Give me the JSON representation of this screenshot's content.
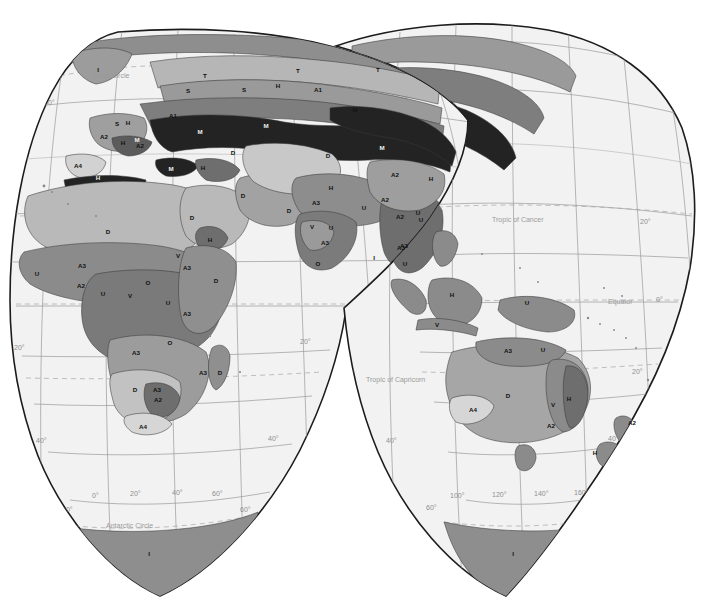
{
  "figure": {
    "kind": "world-map",
    "projection": "interrupted-sinusoidal-homolosine",
    "background_color": "#ffffff",
    "ocean_color": "#f2f2f2",
    "outline_color": "#1c1c1c",
    "graticule_color": "#9a9a9a"
  },
  "reference_lines": [
    {
      "name": "arctic-circle",
      "label": "Arctic Circle"
    },
    {
      "name": "tropic-of-cancer",
      "label": "Tropic of Cancer"
    },
    {
      "name": "equator",
      "label": "Equator"
    },
    {
      "name": "tropic-of-capricorn",
      "label": "Tropic of Capricorn"
    },
    {
      "name": "antarctic-circle",
      "label": "Antarctic Circle"
    }
  ],
  "graticule_labels": {
    "latitudes_left_lobe": [
      "60°",
      "20°",
      "20°",
      "40°",
      "60°"
    ],
    "latitudes_right_lobe": [
      "20°",
      "0°",
      "20°",
      "40°",
      "60°"
    ],
    "longitudes_left_lobe": [
      "0°",
      "20°",
      "40°",
      "60°"
    ],
    "longitudes_right_lobe": [
      "100°",
      "120°",
      "140°",
      "160°"
    ],
    "edge_left": "60°",
    "edge_right": "60°"
  },
  "zone_palette": {
    "ice": "#8e8e8e",
    "tundra": "#9c9c9c",
    "very_dark": "#232323",
    "dark": "#4d4d4d",
    "mid_dark": "#6f6f6f",
    "mid": "#8b8b8b",
    "mid_light": "#a6a6a6",
    "light": "#bdbdbd",
    "very_light": "#d6d6d6",
    "pale": "#e6e6e6"
  },
  "zone_labels": [
    {
      "code": "I",
      "x": 98,
      "y": 72,
      "tone": "light"
    },
    {
      "code": "T",
      "x": 205,
      "y": 78,
      "tone": "dark"
    },
    {
      "code": "T",
      "x": 298,
      "y": 73,
      "tone": "dark"
    },
    {
      "code": "S",
      "x": 188,
      "y": 93,
      "tone": "dark"
    },
    {
      "code": "S",
      "x": 244,
      "y": 92,
      "tone": "dark"
    },
    {
      "code": "H",
      "x": 278,
      "y": 88,
      "tone": "dark"
    },
    {
      "code": "A1",
      "x": 318,
      "y": 92,
      "tone": "dark"
    },
    {
      "code": "H",
      "x": 355,
      "y": 112,
      "tone": "dark"
    },
    {
      "code": "T",
      "x": 378,
      "y": 72,
      "tone": "dark"
    },
    {
      "code": "H",
      "x": 128,
      "y": 125,
      "tone": "dark"
    },
    {
      "code": "A1",
      "x": 173,
      "y": 118,
      "tone": "dark"
    },
    {
      "code": "M",
      "x": 200,
      "y": 134,
      "tone": "lt"
    },
    {
      "code": "M",
      "x": 266,
      "y": 128,
      "tone": "lt"
    },
    {
      "code": "M",
      "x": 382,
      "y": 150,
      "tone": "lt"
    },
    {
      "code": "S",
      "x": 117,
      "y": 126,
      "tone": "dark"
    },
    {
      "code": "A2",
      "x": 104,
      "y": 139,
      "tone": "dark"
    },
    {
      "code": "H",
      "x": 123,
      "y": 145,
      "tone": "dark"
    },
    {
      "code": "M",
      "x": 137,
      "y": 142,
      "tone": "lt"
    },
    {
      "code": "A2",
      "x": 140,
      "y": 148,
      "tone": "dark"
    },
    {
      "code": "A4",
      "x": 78,
      "y": 168,
      "tone": "dark"
    },
    {
      "code": "H",
      "x": 98,
      "y": 180,
      "tone": "lt"
    },
    {
      "code": "M",
      "x": 171,
      "y": 171,
      "tone": "lt"
    },
    {
      "code": "H",
      "x": 203,
      "y": 170,
      "tone": "dark"
    },
    {
      "code": "D",
      "x": 233,
      "y": 155,
      "tone": "dark"
    },
    {
      "code": "D",
      "x": 328,
      "y": 158,
      "tone": "dark"
    },
    {
      "code": "A2",
      "x": 395,
      "y": 177,
      "tone": "dark"
    },
    {
      "code": "H",
      "x": 431,
      "y": 181,
      "tone": "dark"
    },
    {
      "code": "D",
      "x": 108,
      "y": 234,
      "tone": "dark"
    },
    {
      "code": "D",
      "x": 192,
      "y": 220,
      "tone": "dark"
    },
    {
      "code": "H",
      "x": 210,
      "y": 242,
      "tone": "dark"
    },
    {
      "code": "D",
      "x": 243,
      "y": 198,
      "tone": "dark"
    },
    {
      "code": "H",
      "x": 331,
      "y": 190,
      "tone": "dark"
    },
    {
      "code": "D",
      "x": 289,
      "y": 213,
      "tone": "dark"
    },
    {
      "code": "A3",
      "x": 316,
      "y": 205,
      "tone": "dark"
    },
    {
      "code": "V",
      "x": 312,
      "y": 229,
      "tone": "dark"
    },
    {
      "code": "U",
      "x": 331,
      "y": 230,
      "tone": "dark"
    },
    {
      "code": "A3",
      "x": 325,
      "y": 245,
      "tone": "dark"
    },
    {
      "code": "A3",
      "x": 404,
      "y": 248,
      "tone": "dark"
    },
    {
      "code": "A2",
      "x": 400,
      "y": 219,
      "tone": "dark"
    },
    {
      "code": "U",
      "x": 418,
      "y": 215,
      "tone": "dark"
    },
    {
      "code": "O",
      "x": 318,
      "y": 266,
      "tone": "dark"
    },
    {
      "code": "I",
      "x": 374,
      "y": 260,
      "tone": "dark"
    },
    {
      "code": "U",
      "x": 37,
      "y": 276,
      "tone": "dark"
    },
    {
      "code": "A3",
      "x": 82,
      "y": 268,
      "tone": "dark"
    },
    {
      "code": "A2",
      "x": 81,
      "y": 288,
      "tone": "dark"
    },
    {
      "code": "U",
      "x": 103,
      "y": 296,
      "tone": "dark"
    },
    {
      "code": "V",
      "x": 178,
      "y": 258,
      "tone": "dark"
    },
    {
      "code": "A3",
      "x": 187,
      "y": 270,
      "tone": "dark"
    },
    {
      "code": "O",
      "x": 148,
      "y": 285,
      "tone": "dark"
    },
    {
      "code": "V",
      "x": 130,
      "y": 298,
      "tone": "dark"
    },
    {
      "code": "U",
      "x": 168,
      "y": 305,
      "tone": "dark"
    },
    {
      "code": "D",
      "x": 216,
      "y": 283,
      "tone": "dark"
    },
    {
      "code": "A3",
      "x": 187,
      "y": 316,
      "tone": "dark"
    },
    {
      "code": "O",
      "x": 170,
      "y": 345,
      "tone": "dark"
    },
    {
      "code": "A3",
      "x": 136,
      "y": 355,
      "tone": "dark"
    },
    {
      "code": "A3",
      "x": 203,
      "y": 375,
      "tone": "dark"
    },
    {
      "code": "D",
      "x": 220,
      "y": 375,
      "tone": "dark"
    },
    {
      "code": "D",
      "x": 135,
      "y": 392,
      "tone": "dark"
    },
    {
      "code": "A3",
      "x": 157,
      "y": 392,
      "tone": "dark"
    },
    {
      "code": "A2",
      "x": 158,
      "y": 402,
      "tone": "dark"
    },
    {
      "code": "A4",
      "x": 143,
      "y": 429,
      "tone": "dark"
    },
    {
      "code": "I",
      "x": 149,
      "y": 556,
      "tone": "dark"
    },
    {
      "code": "A2",
      "x": 385,
      "y": 202,
      "tone": "dark"
    },
    {
      "code": "U",
      "x": 364,
      "y": 210,
      "tone": "dark"
    },
    {
      "code": "U",
      "x": 421,
      "y": 222,
      "tone": "dark"
    },
    {
      "code": "A3",
      "x": 401,
      "y": 250,
      "tone": "dark"
    },
    {
      "code": "U",
      "x": 405,
      "y": 266,
      "tone": "dark"
    },
    {
      "code": "H",
      "x": 452,
      "y": 297,
      "tone": "dark"
    },
    {
      "code": "V",
      "x": 437,
      "y": 327,
      "tone": "dark"
    },
    {
      "code": "U",
      "x": 527,
      "y": 305,
      "tone": "dark"
    },
    {
      "code": "A3",
      "x": 508,
      "y": 353,
      "tone": "dark"
    },
    {
      "code": "U",
      "x": 543,
      "y": 352,
      "tone": "dark"
    },
    {
      "code": "D",
      "x": 508,
      "y": 398,
      "tone": "dark"
    },
    {
      "code": "V",
      "x": 553,
      "y": 407,
      "tone": "dark"
    },
    {
      "code": "H",
      "x": 569,
      "y": 401,
      "tone": "dark"
    },
    {
      "code": "A2",
      "x": 551,
      "y": 428,
      "tone": "dark"
    },
    {
      "code": "A4",
      "x": 473,
      "y": 412,
      "tone": "dark"
    },
    {
      "code": "A2",
      "x": 632,
      "y": 425,
      "tone": "dark"
    },
    {
      "code": "H",
      "x": 595,
      "y": 455,
      "tone": "dark"
    },
    {
      "code": "I",
      "x": 513,
      "y": 556,
      "tone": "dark"
    }
  ]
}
